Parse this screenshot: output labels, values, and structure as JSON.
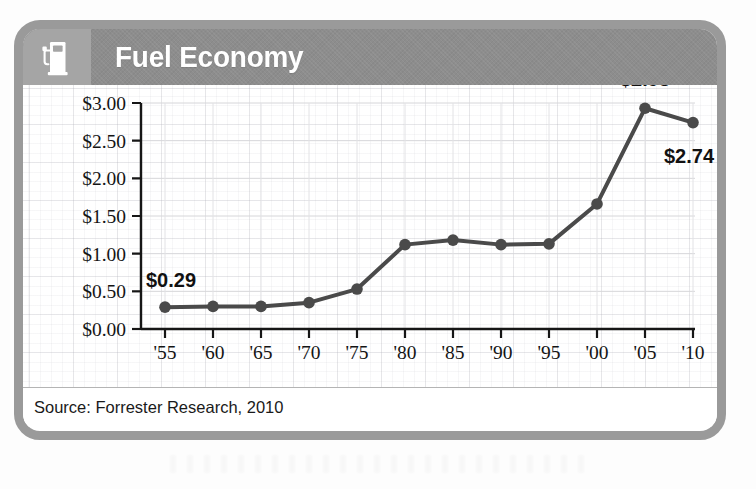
{
  "card": {
    "header": {
      "title": "Fuel Economy",
      "icon": "gas-pump-icon",
      "bar_color": "#8d8d8d",
      "icon_tile_color": "#a5a5a5",
      "title_color": "#ffffff"
    },
    "footer": {
      "source": "Source: Forrester Research, 2010"
    },
    "border_color": "#9a9a9a",
    "background_color": "#ffffff"
  },
  "chart_data": {
    "type": "line",
    "title": "Fuel Economy",
    "xlabel": "",
    "ylabel": "",
    "x": [
      "'55",
      "'60",
      "'65",
      "'70",
      "'75",
      "'80",
      "'85",
      "'90",
      "'95",
      "'00",
      "'05",
      "'10"
    ],
    "values": [
      0.29,
      0.3,
      0.3,
      0.35,
      0.53,
      1.12,
      1.18,
      1.12,
      1.13,
      1.66,
      2.93,
      2.74
    ],
    "ylim": [
      0,
      3.0
    ],
    "ytick_values": [
      0.0,
      0.5,
      1.0,
      1.5,
      2.0,
      2.5,
      3.0
    ],
    "ytick_labels": [
      "$0.00",
      "$0.50",
      "$1.00",
      "$1.50",
      "$2.00",
      "$2.50",
      "$3.00"
    ],
    "xtick_labels": [
      "'55",
      "'60",
      "'65",
      "'70",
      "'75",
      "'80",
      "'85",
      "'90",
      "'95",
      "'00",
      "'05",
      "'10"
    ],
    "grid": true,
    "legend": false,
    "series_color": "#4a4a4a",
    "marker": "circle",
    "annotations": [
      {
        "name": "first-point-label",
        "text": "$0.29",
        "x": "'55",
        "value": 0.29
      },
      {
        "name": "peak-point-label",
        "text": "$2.93",
        "x": "'05",
        "value": 2.93
      },
      {
        "name": "last-point-label",
        "text": "$2.74",
        "x": "'10",
        "value": 2.74
      }
    ]
  }
}
